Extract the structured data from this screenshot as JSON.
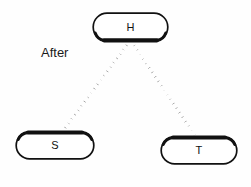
{
  "diagram": {
    "caption": "After",
    "background_color": "#fefefe",
    "stroke_color": "#111111",
    "nodes": [
      {
        "id": "h",
        "label": "H",
        "shape": "rounded-rectangle",
        "shadow_edge": "bottom"
      },
      {
        "id": "s",
        "label": "S",
        "shape": "rounded-rectangle",
        "shadow_edge": "top"
      },
      {
        "id": "t",
        "label": "T",
        "shape": "rounded-rectangle",
        "shadow_edge": "top"
      }
    ],
    "edges": [
      {
        "id": "h-s",
        "from": "h",
        "to": "s",
        "style": "dotted"
      },
      {
        "id": "h-t",
        "from": "h",
        "to": "t",
        "style": "dotted"
      }
    ]
  }
}
